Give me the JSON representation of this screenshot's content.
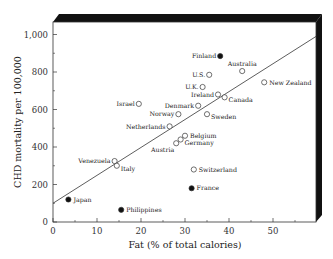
{
  "chart_data": {
    "type": "scatter",
    "title": "",
    "xlabel": "Fat (% of total calories)",
    "ylabel": "CHD mortality per 100,000",
    "xlim": [
      0,
      60
    ],
    "ylim": [
      0,
      1050
    ],
    "xticks": [
      0,
      10,
      20,
      30,
      40,
      50
    ],
    "xtick_labels": [
      "0",
      "10",
      "20",
      "30",
      "40",
      "50"
    ],
    "yticks": [
      0,
      200,
      400,
      600,
      800,
      1000
    ],
    "ytick_labels": [
      "0",
      "200",
      "400",
      "600",
      "800",
      "1,000"
    ],
    "grid": false,
    "legend": null,
    "marker_legend": {
      "open_circle": "country (open marker)",
      "filled_circle": "country (filled marker, outlier)"
    },
    "trend_line": {
      "x": [
        0,
        59.8
      ],
      "y": [
        100,
        990
      ]
    },
    "points": [
      {
        "label": "Finland",
        "x": 38,
        "y": 885,
        "filled": true,
        "label_side": "left"
      },
      {
        "label": "Australia",
        "x": 43,
        "y": 805,
        "filled": false,
        "label_side": "above"
      },
      {
        "label": "U.S.",
        "x": 35.5,
        "y": 785,
        "filled": false,
        "label_side": "left"
      },
      {
        "label": "New Zealand",
        "x": 48,
        "y": 745,
        "filled": false,
        "label_side": "right"
      },
      {
        "label": "U.K.",
        "x": 34,
        "y": 720,
        "filled": false,
        "label_side": "left"
      },
      {
        "label": "Ireland",
        "x": 37.5,
        "y": 680,
        "filled": false,
        "label_side": "left"
      },
      {
        "label": "Canada",
        "x": 39,
        "y": 665,
        "filled": false,
        "label_side": "right-below"
      },
      {
        "label": "Israel",
        "x": 19.5,
        "y": 630,
        "filled": false,
        "label_side": "left"
      },
      {
        "label": "Denmark",
        "x": 33,
        "y": 620,
        "filled": false,
        "label_side": "left"
      },
      {
        "label": "Norway",
        "x": 28.5,
        "y": 575,
        "filled": false,
        "label_side": "left"
      },
      {
        "label": "Sweden",
        "x": 35,
        "y": 575,
        "filled": false,
        "label_side": "right-below"
      },
      {
        "label": "Netherlands",
        "x": 26.5,
        "y": 510,
        "filled": false,
        "label_side": "left"
      },
      {
        "label": "Belgium",
        "x": 30,
        "y": 460,
        "filled": false,
        "label_side": "right"
      },
      {
        "label": "Germany",
        "x": 29,
        "y": 440,
        "filled": false,
        "label_side": "right-below"
      },
      {
        "label": "Austria",
        "x": 28,
        "y": 420,
        "filled": false,
        "label_side": "below-left"
      },
      {
        "label": "Venezuela",
        "x": 14,
        "y": 325,
        "filled": false,
        "label_side": "left"
      },
      {
        "label": "Italy",
        "x": 14.5,
        "y": 300,
        "filled": false,
        "label_side": "right-below"
      },
      {
        "label": "Switzerland",
        "x": 32,
        "y": 280,
        "filled": false,
        "label_side": "right"
      },
      {
        "label": "France",
        "x": 31.5,
        "y": 180,
        "filled": true,
        "label_side": "right"
      },
      {
        "label": "Japan",
        "x": 3.5,
        "y": 120,
        "filled": true,
        "label_side": "right"
      },
      {
        "label": "Philippines",
        "x": 15.5,
        "y": 65,
        "filled": true,
        "label_side": "right"
      }
    ]
  },
  "colors": {
    "frame": "#111111",
    "marker_stroke": "#333333",
    "filled_marker": "#111111",
    "trend_line": "#333333",
    "background": "#ffffff"
  }
}
